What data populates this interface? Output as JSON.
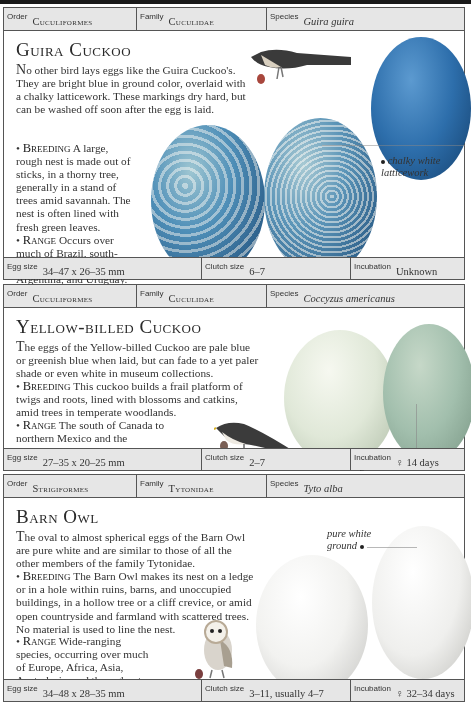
{
  "entries": [
    {
      "header": {
        "order_label": "Order",
        "order": "Cuculiformes",
        "family_label": "Family",
        "family": "Cuculidae",
        "species_label": "Species",
        "species": "Guira guira"
      },
      "title": "Guira Cuckoo",
      "intro_initial": "N",
      "intro": "o other bird lays eggs like the Guira Cuckoo's. They are bright blue in ground color, overlaid with a chalky latticework. These markings dry hard, but can be washed off soon after the egg is laid.",
      "breeding_label": "Breeding",
      "breeding": "A large, rough nest is made out of sticks, in a thorny tree, generally in a stand of trees amid savannah. The nest is often lined with fresh green leaves.",
      "range_label": "Range",
      "range": "Occurs over much of Brazil, south-eastern Bolivia, northern Argentina, and Uruguay.",
      "annotation": "chalky white latticework",
      "footer": {
        "egg_size_label": "Egg size",
        "egg_size": "34–47 x 26–35 mm",
        "clutch_label": "Clutch size",
        "clutch": "6–7",
        "incubation_label": "Incubation",
        "incubation": "Unknown"
      },
      "colors": {
        "egg_blue": "#3f7fb8",
        "lattice": "#b8c9c2",
        "plain_egg": "#2e6fae"
      }
    },
    {
      "header": {
        "order_label": "Order",
        "order": "Cuculiformes",
        "family_label": "Family",
        "family": "Cuculidae",
        "species_label": "Species",
        "species": "Coccyzus americanus"
      },
      "title": "Yellow-billed Cuckoo",
      "intro_initial": "T",
      "intro": "he eggs of the Yellow-billed Cuckoo are pale blue or greenish blue when laid, but can fade to a yet paler shade or even white in museum collections.",
      "breeding_label": "Breeding",
      "breeding": "This cuckoo builds a frail platform of twigs and roots, lined with blossoms and catkins, amid trees in temperate woodlands.",
      "range_label": "Range",
      "range": "The south of Canada to northern Mexico and the Caribbean islands. It winters in South America.",
      "annotation": "pale greenish blue ground",
      "footer": {
        "egg_size_label": "Egg size",
        "egg_size": "27–35 x 20–25 mm",
        "clutch_label": "Clutch size",
        "clutch": "2–7",
        "incubation_label": "Incubation",
        "incubation": "♀ 14 days"
      },
      "colors": {
        "egg_pale": "#dfe7d9",
        "egg_green": "#a9c3b0"
      }
    },
    {
      "header": {
        "order_label": "Order",
        "order": "Strigiformes",
        "family_label": "Family",
        "family": "Tytonidae",
        "species_label": "Species",
        "species": "Tyto alba"
      },
      "title": "Barn Owl",
      "intro_initial": "T",
      "intro": "he oval to almost spherical eggs of the Barn Owl are pure white and are similar to those of all the other members of the family Tytonidae.",
      "breeding_label": "Breeding",
      "breeding": "The Barn Owl makes its nest on a ledge or in a hole within ruins, barns, and unoccupied buildings, in a hollow tree or a cliff crevice, or amid open countryside and farmland with scattered trees. No material is used to line the nest.",
      "range_label": "Range",
      "range": "Wide-ranging species, occurring over much of Europe, Africa, Asia, Australasia, and throughout the Americas.",
      "annotation": "pure white ground",
      "footer": {
        "egg_size_label": "Egg size",
        "egg_size": "34–48 x 28–35 mm",
        "clutch_label": "Clutch size",
        "clutch": "3–11, usually 4–7",
        "incubation_label": "Incubation",
        "incubation": "♀ 32–34 days"
      },
      "colors": {
        "egg_white": "#f2f2f0"
      }
    }
  ]
}
